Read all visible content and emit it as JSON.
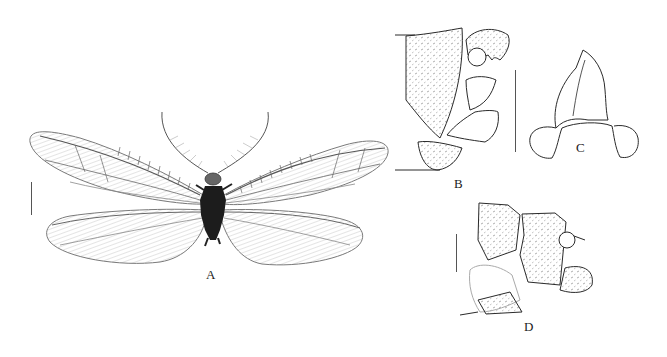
{
  "figure": {
    "panels": [
      {
        "id": "A",
        "label": "A",
        "content": "habitus, dorsal view, wings spread, pectinate antennae"
      },
      {
        "id": "B",
        "label": "B",
        "content": "male terminalia, lateral view"
      },
      {
        "id": "C",
        "label": "C",
        "content": "gonarcus complex"
      },
      {
        "id": "D",
        "label": "D",
        "content": "female terminalia, lateral view"
      }
    ],
    "scale_bars": [
      {
        "panel": "A"
      },
      {
        "panel": "B-C"
      },
      {
        "panel": "D"
      }
    ],
    "colors": {
      "ink": "#2a2a2a",
      "wing": "#9a9a9a",
      "body": "#1c1c1c",
      "background": "#ffffff"
    }
  }
}
